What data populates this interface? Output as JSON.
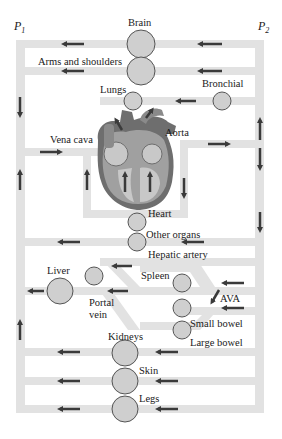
{
  "pressure_labels": {
    "left": "P",
    "left_sub": "1",
    "right": "P",
    "right_sub": "2"
  },
  "organs": {
    "brain": "Brain",
    "arms": "Arms and shoulders",
    "lungs": "Lungs",
    "bronchial": "Bronchial",
    "vena_cava": "Vena cava",
    "aorta": "Aorta",
    "heart": "Heart",
    "other_organs": "Other organs",
    "hepatic_artery": "Hepatic artery",
    "liver": "Liver",
    "spleen": "Spleen",
    "portal_vein_1": "Portal",
    "portal_vein_2": "vein",
    "ava": "AVA",
    "small_bowel": "Small bowel",
    "large_bowel": "Large bowel",
    "kidneys": "Kidneys",
    "skin": "Skin",
    "legs": "Legs"
  },
  "colors": {
    "pipe": "#e2e2e2",
    "organ_fill": "#cfcfcf",
    "organ_stroke": "#555555",
    "arrow": "#3a3a3a",
    "heart_dark": "#6e6e6e",
    "heart_mid": "#a0a0a0",
    "heart_light": "#c8c8c8"
  }
}
